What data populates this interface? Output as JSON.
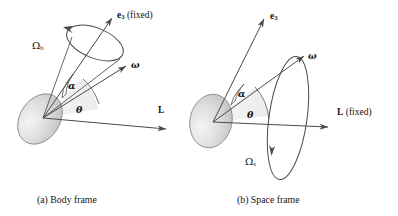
{
  "figure": {
    "background": "#ffffff",
    "stroke_color": "#4a4a4a",
    "body_fill_light": "#f0f0f0",
    "body_fill_dark": "#b8b8b8"
  },
  "panels": [
    {
      "id": "a",
      "caption": "(a) Body frame",
      "vectors": [
        {
          "name": "e3",
          "label_main": "e",
          "label_sub": "3",
          "label_suffix": " (fixed)"
        },
        {
          "name": "omega",
          "label_main": "ω",
          "label_sub": "",
          "label_suffix": ""
        },
        {
          "name": "L",
          "label_main": "L",
          "label_sub": "",
          "label_suffix": ""
        }
      ],
      "angles": [
        {
          "name": "alpha",
          "label": "α"
        },
        {
          "name": "theta",
          "label": "θ"
        }
      ],
      "precession": {
        "name": "Omega_b",
        "label_main": "Ω",
        "label_sub": "b"
      }
    },
    {
      "id": "b",
      "caption": "(b) Space frame",
      "vectors": [
        {
          "name": "e3",
          "label_main": "e",
          "label_sub": "3",
          "label_suffix": ""
        },
        {
          "name": "omega",
          "label_main": "ω",
          "label_sub": "",
          "label_suffix": ""
        },
        {
          "name": "L",
          "label_main": "L",
          "label_sub": "",
          "label_suffix": " (fixed)"
        }
      ],
      "angles": [
        {
          "name": "alpha",
          "label": "α"
        },
        {
          "name": "theta",
          "label": "θ"
        }
      ],
      "precession": {
        "name": "Omega_s",
        "label_main": "Ω",
        "label_sub": "s"
      }
    }
  ],
  "labels": {
    "a_e3_main": "e",
    "a_e3_sub": "3",
    "a_e3_suffix": " (fixed)",
    "a_omega": "ω",
    "a_L": "L",
    "a_alpha": "α",
    "a_theta": "θ",
    "a_omega_big": "Ω",
    "a_omega_big_sub": "b",
    "a_caption": "(a) Body frame",
    "b_e3_main": "e",
    "b_e3_sub": "3",
    "b_omega": "ω",
    "b_L": "L",
    "b_L_suffix": " (fixed)",
    "b_alpha": "α",
    "b_theta": "θ",
    "b_omega_big": "Ω",
    "b_omega_big_sub": "s",
    "b_caption": "(b) Space frame"
  }
}
